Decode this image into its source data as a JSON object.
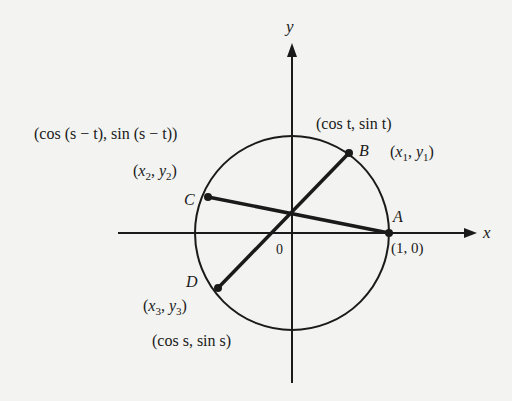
{
  "axes": {
    "x_label": "x",
    "y_label": "y",
    "origin_label": "0"
  },
  "points": {
    "A": {
      "name": "A",
      "coords": "(1, 0)"
    },
    "B": {
      "name": "B",
      "trig": "(cos t, sin t)",
      "xvar": "x",
      "xsub": "1",
      "yvar": "y",
      "ysub": "1"
    },
    "C": {
      "name": "C",
      "trig": "(cos (s − t), sin (s − t))",
      "xvar": "x",
      "xsub": "2",
      "yvar": "y",
      "ysub": "2"
    },
    "D": {
      "name": "D",
      "trig": "(cos s, sin s)",
      "xvar": "x",
      "xsub": "3",
      "yvar": "y",
      "ysub": "3"
    }
  },
  "colors": {
    "ink": "#1a1a1a",
    "paper": "#f3f3f1"
  }
}
